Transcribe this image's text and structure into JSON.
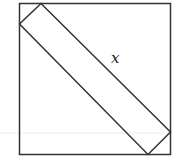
{
  "diagram": {
    "type": "geometry",
    "label": "x",
    "colors": {
      "stroke": "#333333",
      "background": "#ffffff",
      "guide": "#eeeeee"
    },
    "outer_square": {
      "x": 19,
      "y": 3,
      "width": 151,
      "height": 152
    },
    "inner_rectangle": {
      "points": [
        [
          41,
          3
        ],
        [
          19,
          24
        ],
        [
          148,
          154
        ],
        [
          170,
          132
        ]
      ]
    },
    "label_position": {
      "x": 111,
      "y": 63
    }
  }
}
